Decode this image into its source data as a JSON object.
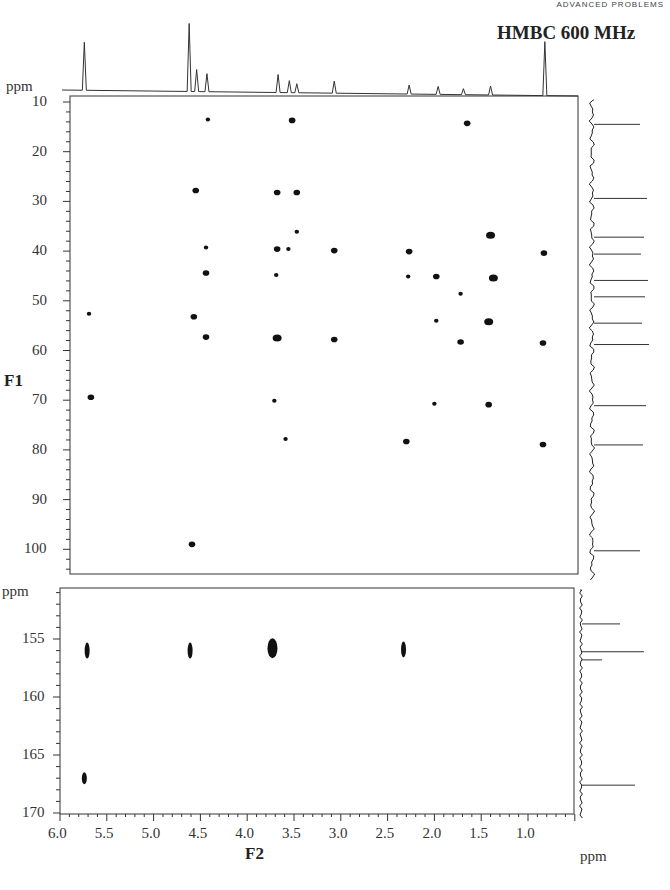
{
  "header": {
    "running_head": "ADVANCED PROBLEMS"
  },
  "chart_data": {
    "type": "heatmap",
    "title": "HMBC 600 MHz",
    "xlabel": "F2",
    "ylabel": "F1",
    "x_unit": "ppm",
    "y_unit": "ppm",
    "x_range": [
      6.0,
      0.5
    ],
    "x_ticks": [
      "6.0",
      "5.5",
      "5.0",
      "4.5",
      "4.0",
      "3.5",
      "3.0",
      "2.5",
      "2.0",
      "1.5",
      "1.0"
    ],
    "panels": [
      {
        "name": "upper",
        "y_range": [
          9,
          105
        ],
        "y_ticks": [
          "10",
          "20",
          "30",
          "40",
          "50",
          "60",
          "70",
          "80",
          "90",
          "100"
        ],
        "peaks": [
          {
            "x": 4.42,
            "y": 13.5,
            "s": 1
          },
          {
            "x": 3.52,
            "y": 13.7,
            "s": 2
          },
          {
            "x": 1.65,
            "y": 14.3,
            "s": 2
          },
          {
            "x": 4.55,
            "y": 27.8,
            "s": 2
          },
          {
            "x": 3.68,
            "y": 28.2,
            "s": 2
          },
          {
            "x": 3.47,
            "y": 28.2,
            "s": 2
          },
          {
            "x": 3.47,
            "y": 36.1,
            "s": 1
          },
          {
            "x": 1.4,
            "y": 36.8,
            "s": 3
          },
          {
            "x": 4.44,
            "y": 39.3,
            "s": 1
          },
          {
            "x": 3.68,
            "y": 39.6,
            "s": 2
          },
          {
            "x": 3.56,
            "y": 39.6,
            "s": 1
          },
          {
            "x": 3.07,
            "y": 39.9,
            "s": 2
          },
          {
            "x": 2.27,
            "y": 40.1,
            "s": 2
          },
          {
            "x": 0.83,
            "y": 40.4,
            "s": 2
          },
          {
            "x": 4.44,
            "y": 44.4,
            "s": 2
          },
          {
            "x": 3.69,
            "y": 44.8,
            "s": 1
          },
          {
            "x": 2.28,
            "y": 45.1,
            "s": 1
          },
          {
            "x": 1.98,
            "y": 45.1,
            "s": 2
          },
          {
            "x": 1.37,
            "y": 45.4,
            "s": 3
          },
          {
            "x": 1.72,
            "y": 48.6,
            "s": 1
          },
          {
            "x": 5.69,
            "y": 52.6,
            "s": 1
          },
          {
            "x": 4.57,
            "y": 53.2,
            "s": 2
          },
          {
            "x": 1.98,
            "y": 54.0,
            "s": 1
          },
          {
            "x": 1.42,
            "y": 54.2,
            "s": 3
          },
          {
            "x": 4.44,
            "y": 57.3,
            "s": 2
          },
          {
            "x": 3.68,
            "y": 57.5,
            "s": 3
          },
          {
            "x": 3.07,
            "y": 57.8,
            "s": 2
          },
          {
            "x": 1.72,
            "y": 58.3,
            "s": 2
          },
          {
            "x": 0.84,
            "y": 58.5,
            "s": 2
          },
          {
            "x": 5.67,
            "y": 69.4,
            "s": 2
          },
          {
            "x": 3.71,
            "y": 70.1,
            "s": 1
          },
          {
            "x": 2.0,
            "y": 70.7,
            "s": 1
          },
          {
            "x": 1.42,
            "y": 70.9,
            "s": 2
          },
          {
            "x": 3.59,
            "y": 77.8,
            "s": 1
          },
          {
            "x": 2.3,
            "y": 78.3,
            "s": 2
          },
          {
            "x": 0.84,
            "y": 78.9,
            "s": 2
          },
          {
            "x": 4.59,
            "y": 99.0,
            "s": 2
          }
        ],
        "projection_peaks_ppm": [
          14.5,
          29.4,
          37.2,
          40.6,
          45.9,
          49.2,
          54.5,
          58.8,
          71.1,
          79.0,
          100.3
        ]
      },
      {
        "name": "lower",
        "y_range": [
          150.5,
          170
        ],
        "y_ticks": [
          "155",
          "160",
          "165",
          "170"
        ],
        "peaks": [
          {
            "x": 5.71,
            "y": 156.0,
            "s": 2
          },
          {
            "x": 4.61,
            "y": 156.0,
            "s": 2
          },
          {
            "x": 3.73,
            "y": 155.8,
            "s": 4
          },
          {
            "x": 2.33,
            "y": 155.9,
            "s": 2
          },
          {
            "x": 5.74,
            "y": 167.0,
            "s": 1
          }
        ],
        "projection_peaks_ppm": [
          153.7,
          156.1,
          156.8,
          167.6
        ]
      }
    ],
    "f2_projection_peaks_ppm": [
      {
        "x": 5.74,
        "h": 48
      },
      {
        "x": 4.62,
        "h": 68
      },
      {
        "x": 4.54,
        "h": 22
      },
      {
        "x": 4.43,
        "h": 18
      },
      {
        "x": 3.67,
        "h": 18
      },
      {
        "x": 3.55,
        "h": 12
      },
      {
        "x": 3.47,
        "h": 9
      },
      {
        "x": 3.07,
        "h": 12
      },
      {
        "x": 2.27,
        "h": 9
      },
      {
        "x": 1.96,
        "h": 8
      },
      {
        "x": 1.69,
        "h": 6
      },
      {
        "x": 1.4,
        "h": 9
      },
      {
        "x": 0.82,
        "h": 54
      }
    ]
  }
}
